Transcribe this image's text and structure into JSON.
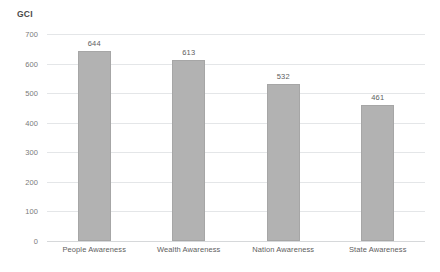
{
  "chart_data": {
    "type": "bar",
    "title": "GCI",
    "xlabel": "",
    "ylabel": "",
    "categories": [
      "People Awareness",
      "Wealth Awareness",
      "Nation Awareness",
      "State Awareness"
    ],
    "values": [
      644,
      613,
      532,
      461
    ],
    "value_labels": [
      "644",
      "613",
      "532",
      "461"
    ],
    "ylim": [
      0,
      700
    ],
    "ytick_labels": [
      "0",
      "100",
      "200",
      "300",
      "400",
      "500",
      "600",
      "700"
    ],
    "ytick_values": [
      0,
      100,
      200,
      300,
      400,
      500,
      600,
      700
    ],
    "grid": "horizontal",
    "legend": "none",
    "series": [
      {
        "name": "GCI",
        "values": [
          644,
          613,
          532,
          461
        ]
      }
    ],
    "colors": {
      "bar_fill": "#b2b2b2",
      "bar_border": "#a6a6a6",
      "gridline": "#e4e6e8",
      "baseline": "#d6d8da",
      "title_text": "#4a4a4a",
      "tick_text": "#7b7b7b",
      "label_text": "#5e5e5e",
      "background": "#ffffff"
    }
  }
}
